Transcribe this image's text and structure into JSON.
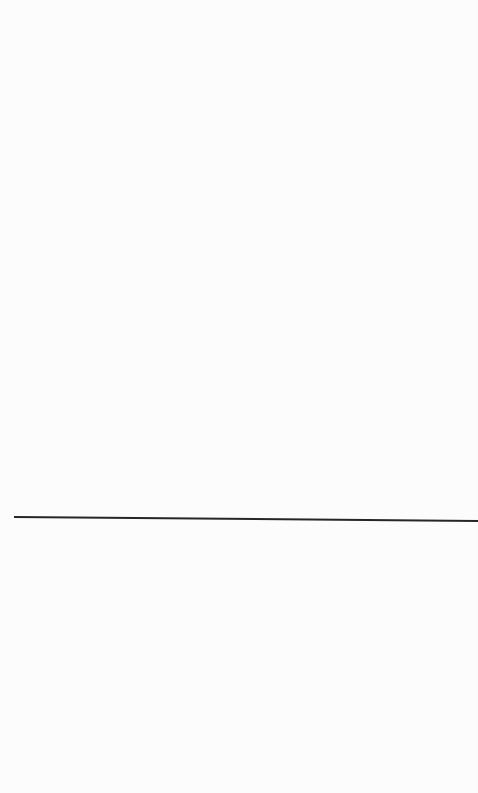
{
  "page": {
    "background_color": "#fcfcfc",
    "content": []
  },
  "separator": {
    "color": "#262626",
    "orientation": "horizontal"
  }
}
